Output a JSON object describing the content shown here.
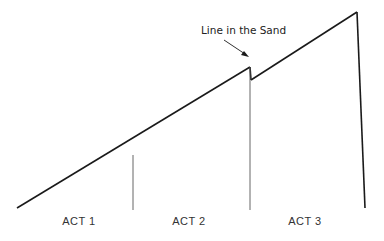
{
  "diagram": {
    "annotation": "Line in the Sand",
    "acts": [
      {
        "label": "ACT 1"
      },
      {
        "label": "ACT 2"
      },
      {
        "label": "ACT 3"
      }
    ],
    "colors": {
      "line": "#1a1a1a",
      "divider": "#555555",
      "text": "#222222"
    }
  }
}
